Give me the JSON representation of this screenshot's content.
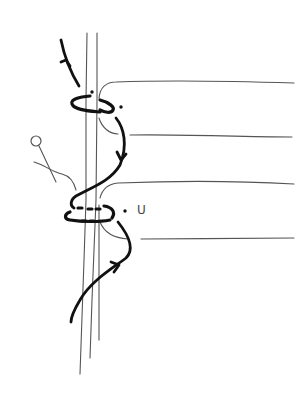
{
  "diagram": {
    "labels": [
      {
        "id": "u",
        "text": "U"
      }
    ],
    "colors": {
      "background": "#ffffff",
      "cord": "#111111",
      "strand": "#555555"
    },
    "elements": {
      "vertical_core_cords": 3,
      "horizontal_strands": 4,
      "wrap_loops": 2,
      "direction_arrows": 3,
      "pin": 1
    }
  }
}
